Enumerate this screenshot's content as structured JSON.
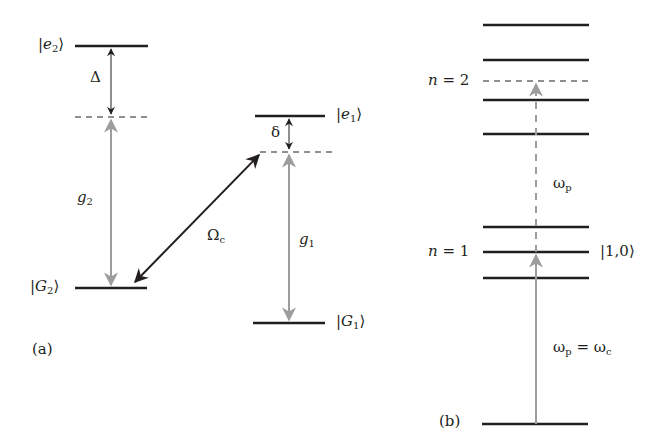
{
  "panel_a": {
    "label": "(a)",
    "states": {
      "e2": {
        "ket_letter": "e",
        "sub": "2"
      },
      "e1": {
        "ket_letter": "e",
        "sub": "1"
      },
      "G2": {
        "ket_letter": "G",
        "sub": "2"
      },
      "G1": {
        "ket_letter": "G",
        "sub": "1"
      }
    },
    "detuning_large": "Δ",
    "detuning_small": "δ",
    "coupling_2": {
      "letter": "g",
      "sub": "2"
    },
    "coupling_1": {
      "letter": "g",
      "sub": "1"
    },
    "control": {
      "letter": "Ω",
      "sub": "c"
    }
  },
  "panel_b": {
    "label": "(b)",
    "n2": {
      "letter": "n",
      "rest": " = 2"
    },
    "n1": {
      "letter": "n",
      "rest": " = 1"
    },
    "state_10": "|1,0⟩",
    "omega_p": {
      "letter": "ω",
      "sub": "p"
    },
    "resonance": {
      "lhs_letter": "ω",
      "lhs_sub": "p",
      "eq": " = ",
      "rhs_letter": "ω",
      "rhs_sub": "c"
    }
  },
  "colors": {
    "level_line": "#231f20",
    "gray_arrow": "#9d9d9d",
    "black_arrow": "#231f20"
  }
}
